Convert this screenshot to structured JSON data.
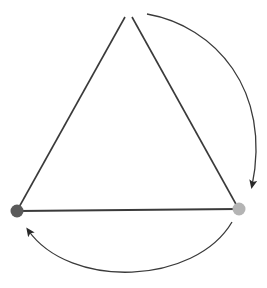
{
  "diagram": {
    "type": "triangle-cycle",
    "colors": {
      "background": "#ffffff",
      "edge": "#3a3a3a",
      "arrow": "#2a2a2a",
      "node_dark": "#5a5a5a",
      "node_light": "#b4b4b4"
    },
    "nodes": [
      {
        "id": "top",
        "x": 128,
        "y": 14,
        "visible_dot": false
      },
      {
        "id": "bottom-left",
        "x": 17,
        "y": 211,
        "color": "#5a5a5a"
      },
      {
        "id": "bottom-right",
        "x": 239,
        "y": 209,
        "color": "#b4b4b4"
      }
    ],
    "edges": [
      {
        "from": "top",
        "to": "bottom-left"
      },
      {
        "from": "top",
        "to": "bottom-right"
      },
      {
        "from": "bottom-left",
        "to": "bottom-right"
      }
    ],
    "arrows": [
      {
        "from": "top",
        "to": "bottom-right",
        "direction": "clockwise"
      },
      {
        "from": "bottom-right",
        "to": "bottom-left",
        "direction": "clockwise"
      }
    ]
  }
}
